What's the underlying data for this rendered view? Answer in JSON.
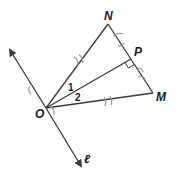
{
  "diagram": {
    "points": {
      "N": {
        "label": "N",
        "x": 108,
        "y": 24
      },
      "P": {
        "label": "P",
        "x": 131,
        "y": 59
      },
      "M": {
        "label": "M",
        "x": 153,
        "y": 93
      },
      "O": {
        "label": "O",
        "x": 46,
        "y": 108
      }
    },
    "line": {
      "label": "ℓ",
      "from": [
        10,
        50
      ],
      "to": [
        81,
        167
      ]
    },
    "angles": {
      "angle1": "1",
      "angle2": "2"
    },
    "segments": [
      "ON",
      "OP",
      "OM",
      "NM"
    ],
    "markers": [
      "right-angle-at-P",
      "compass-arcs"
    ],
    "colors": {
      "line": "#3a3a3a",
      "arc": "#9a9a9a",
      "text": "#1a1a1a"
    }
  }
}
